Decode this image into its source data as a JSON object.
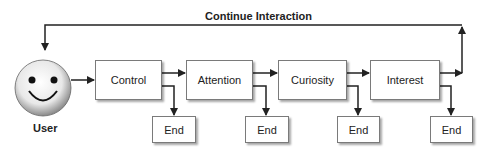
{
  "diagram": {
    "loop_label": "Continue Interaction",
    "user_label": "User",
    "stages": [
      {
        "label": "Control",
        "end_label": "End"
      },
      {
        "label": "Attention",
        "end_label": "End"
      },
      {
        "label": "Curiosity",
        "end_label": "End"
      },
      {
        "label": "Interest",
        "end_label": "End"
      }
    ],
    "colors": {
      "line": "#222222",
      "box_border": "#7a7a7a",
      "background": "#ffffff"
    }
  }
}
